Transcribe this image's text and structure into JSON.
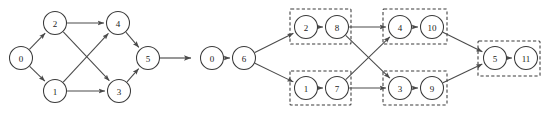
{
  "figure": {
    "title": "",
    "background_color": "#ffffff",
    "node_stroke_color": "#3a3a3a",
    "edge_color": "#4a4a4a",
    "group_box_color": "#3a3a3a",
    "label_color": "#1a1a1a",
    "width": 550,
    "height": 120
  },
  "transform_arrow": {
    "name": "transform-arrow",
    "from_x": 160,
    "to_x": 191,
    "y": 58,
    "label": ""
  },
  "left_graph": {
    "name": "original-dag",
    "caption": "",
    "node_radius": 11.5,
    "nodes": [
      {
        "id": "n0",
        "label": "0",
        "cx": 21,
        "cy": 58
      },
      {
        "id": "n2",
        "label": "2",
        "cx": 55,
        "cy": 23
      },
      {
        "id": "n1",
        "label": "1",
        "cx": 55,
        "cy": 91
      },
      {
        "id": "n4",
        "label": "4",
        "cx": 118,
        "cy": 23
      },
      {
        "id": "n3",
        "label": "3",
        "cx": 119,
        "cy": 91
      },
      {
        "id": "n5",
        "label": "5",
        "cx": 148,
        "cy": 58
      }
    ],
    "edges": [
      {
        "from": "n0",
        "to": "n2"
      },
      {
        "from": "n0",
        "to": "n1"
      },
      {
        "from": "n2",
        "to": "n4"
      },
      {
        "from": "n2",
        "to": "n3"
      },
      {
        "from": "n1",
        "to": "n4"
      },
      {
        "from": "n1",
        "to": "n3"
      },
      {
        "from": "n4",
        "to": "n5"
      },
      {
        "from": "n3",
        "to": "n5"
      }
    ]
  },
  "right_graph": {
    "name": "expanded-dag",
    "caption": "",
    "node_radius": 11.5,
    "nodes": [
      {
        "id": "m0",
        "label": "0",
        "cx": 212,
        "cy": 58
      },
      {
        "id": "m6",
        "label": "6",
        "cx": 244,
        "cy": 58
      },
      {
        "id": "m2",
        "label": "2",
        "cx": 306,
        "cy": 27
      },
      {
        "id": "m8",
        "label": "8",
        "cx": 337,
        "cy": 27
      },
      {
        "id": "m1",
        "label": "1",
        "cx": 306,
        "cy": 88
      },
      {
        "id": "m7",
        "label": "7",
        "cx": 337,
        "cy": 88
      },
      {
        "id": "m4",
        "label": "4",
        "cx": 400,
        "cy": 27
      },
      {
        "id": "m10",
        "label": "10",
        "cx": 432,
        "cy": 27
      },
      {
        "id": "m3",
        "label": "3",
        "cx": 400,
        "cy": 88
      },
      {
        "id": "m9",
        "label": "9",
        "cx": 432,
        "cy": 88
      },
      {
        "id": "m5",
        "label": "5",
        "cx": 495,
        "cy": 58
      },
      {
        "id": "m11",
        "label": "11",
        "cx": 526,
        "cy": 58
      }
    ],
    "edges": [
      {
        "from": "m0",
        "to": "m6"
      },
      {
        "from": "m6",
        "to": "m2"
      },
      {
        "from": "m6",
        "to": "m1"
      },
      {
        "from": "m2",
        "to": "m8"
      },
      {
        "from": "m1",
        "to": "m7"
      },
      {
        "from": "m8",
        "to": "m4"
      },
      {
        "from": "m8",
        "to": "m3"
      },
      {
        "from": "m7",
        "to": "m4"
      },
      {
        "from": "m7",
        "to": "m3"
      },
      {
        "from": "m4",
        "to": "m10"
      },
      {
        "from": "m3",
        "to": "m9"
      },
      {
        "from": "m10",
        "to": "m5"
      },
      {
        "from": "m9",
        "to": "m5"
      },
      {
        "from": "m5",
        "to": "m11"
      }
    ],
    "groups": [
      {
        "name": "group-2-8",
        "x": 290,
        "y": 9,
        "w": 61,
        "h": 35,
        "members": [
          "2",
          "8"
        ]
      },
      {
        "name": "group-1-7",
        "x": 290,
        "y": 71,
        "w": 61,
        "h": 34,
        "members": [
          "1",
          "7"
        ]
      },
      {
        "name": "group-4-10",
        "x": 383,
        "y": 9,
        "w": 64,
        "h": 35,
        "members": [
          "4",
          "10"
        ]
      },
      {
        "name": "group-3-9",
        "x": 383,
        "y": 71,
        "w": 64,
        "h": 34,
        "members": [
          "3",
          "9"
        ]
      },
      {
        "name": "group-5-11",
        "x": 478,
        "y": 41,
        "w": 62,
        "h": 35,
        "members": [
          "5",
          "11"
        ]
      }
    ]
  }
}
